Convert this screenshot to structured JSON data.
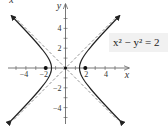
{
  "chart_data": {
    "type": "line",
    "title": "",
    "equation": "x² − y² = 2",
    "xlabel": "x",
    "ylabel": "y",
    "cut_label": "−x",
    "xlim": [
      -5.7,
      6.3
    ],
    "ylim": [
      -5.6,
      6.4
    ],
    "x_ticks": [
      -4,
      -2,
      2,
      4
    ],
    "y_ticks": [
      4,
      2,
      -2,
      -4
    ],
    "x_tick_labels": [
      "−4",
      "−2",
      "2",
      "4"
    ],
    "y_tick_labels": [
      "4",
      "2",
      "−2",
      "−4"
    ],
    "grid": false,
    "series": [
      {
        "name": "hyperbola right branch",
        "style": "solid",
        "arrows": true,
        "vertex": [
          1.414,
          0
        ],
        "x_range": [
          1.414,
          5
        ]
      },
      {
        "name": "hyperbola left branch",
        "style": "solid",
        "arrows": true,
        "vertex": [
          -1.414,
          0
        ],
        "x_range": [
          -5,
          -1.414
        ]
      },
      {
        "name": "asymptote y = x",
        "style": "dashed"
      },
      {
        "name": "asymptote y = −x",
        "style": "dashed"
      }
    ],
    "points": [
      {
        "label": "focus",
        "x": -2,
        "y": 0
      },
      {
        "label": "center",
        "x": 0,
        "y": 0
      },
      {
        "label": "focus",
        "x": 2,
        "y": 0
      }
    ]
  },
  "colors": {
    "curve": "#222222",
    "asymptote": "#888888",
    "axis": "#555555",
    "label_bg": "#f1f1f1"
  }
}
